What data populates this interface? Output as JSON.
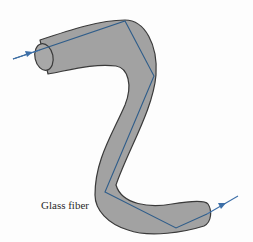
{
  "diagram": {
    "type": "optical-fiber-total-internal-reflection",
    "labels": {
      "fiber": "Glass fiber"
    },
    "colors": {
      "fiber_fill": "#a2a2a2",
      "fiber_outline": "#3a3a3a",
      "ray": "#2f5d8a",
      "arrow": "#3d6fa8",
      "text": "#2a2a2a"
    },
    "ray_path": [
      [
        13,
        59
      ],
      [
        125,
        21
      ],
      [
        154,
        76
      ],
      [
        105,
        192
      ],
      [
        176,
        228
      ],
      [
        207,
        214
      ]
    ],
    "input_arrow": {
      "from": [
        13,
        59
      ],
      "to": [
        33,
        52
      ]
    },
    "output_arrow": {
      "from": [
        207,
        214
      ],
      "to": [
        238,
        196
      ]
    }
  }
}
